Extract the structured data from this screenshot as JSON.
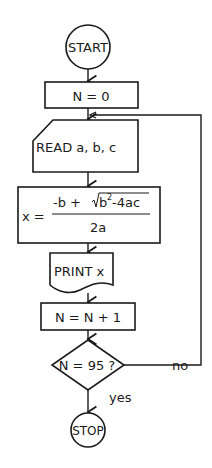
{
  "flowchart": {
    "start": {
      "label": "START"
    },
    "init": {
      "label": "N = 0"
    },
    "read": {
      "label": "READ a, b, c"
    },
    "compute": {
      "lhs": "x =",
      "numerator_prefix": "-b +",
      "radicand": "b",
      "radicand_exp": "2",
      "radicand_rest": "-4ac",
      "denominator": "2a"
    },
    "print": {
      "label": "PRINT x"
    },
    "increment": {
      "label": "N = N + 1"
    },
    "decision": {
      "label": "N = 95 ?",
      "no_label": "no",
      "yes_label": "yes"
    },
    "stop": {
      "label": "STOP"
    }
  },
  "colors": {
    "stroke": "#1a1a1a",
    "background": "#ffffff"
  }
}
